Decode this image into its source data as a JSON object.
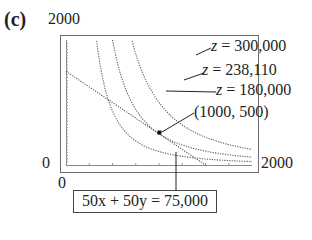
{
  "figure": {
    "panel_label": "(c)",
    "axis": {
      "y_max_label": "2000",
      "x_min_label": "0",
      "y_min_label": "0",
      "x_max_label": "2000"
    },
    "curve_labels": [
      {
        "var": "z",
        "text": " = 300,000"
      },
      {
        "var": "z",
        "text": " = 238,110"
      },
      {
        "var": "z",
        "text": " = 180,000"
      }
    ],
    "point_label": "(1000, 500)",
    "constraint_label": "50x + 50y = 75,000"
  },
  "chart_data": {
    "type": "line",
    "title": "(c)",
    "xlabel": "",
    "ylabel": "",
    "xlim": [
      0,
      2000
    ],
    "ylim": [
      0,
      2000
    ],
    "grid": false,
    "series": [
      {
        "name": "50x + 50y = 75,000",
        "style": "dotted",
        "x": [
          0,
          1500
        ],
        "y": [
          1500,
          0
        ]
      },
      {
        "name": "z = 300,000",
        "style": "dotted",
        "form": "level curve of z = 300 x^(2/3) y^(1/3)",
        "x": [
          520,
          700,
          1000,
          1500,
          2000
        ],
        "y": [
          2000,
          1100,
          540,
          240,
          135
        ]
      },
      {
        "name": "z = 238,110",
        "style": "dotted",
        "form": "level curve of z = 300 x^(2/3) y^(1/3)",
        "x": [
          370,
          500,
          700,
          1000,
          1500,
          2000
        ],
        "y": [
          2000,
          1000,
          510,
          250,
          111,
          62
        ]
      },
      {
        "name": "z = 180,000",
        "style": "dotted",
        "form": "level curve of z = 300 x^(2/3) y^(1/3)",
        "x": [
          240,
          400,
          600,
          1000,
          1500,
          2000
        ],
        "y": [
          2000,
          670,
          300,
          108,
          48,
          27
        ]
      }
    ],
    "points": [
      {
        "label": "(1000, 500)",
        "x": 1000,
        "y": 500
      }
    ],
    "annotations": [
      "z = 300,000",
      "z = 238,110",
      "z = 180,000",
      "(1000, 500)",
      "50x + 50y = 75,000"
    ]
  }
}
